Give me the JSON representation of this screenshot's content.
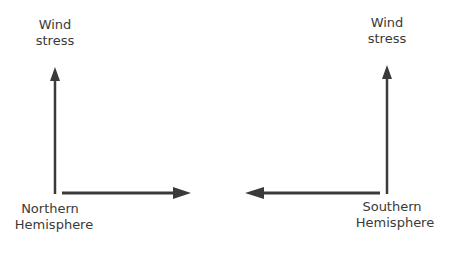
{
  "diagram": {
    "left_panel": {
      "hemisphere_label_line1": "Northern",
      "hemisphere_label_line2": "Hemisphere",
      "vertical_arrow_label_line1": "Wind",
      "vertical_arrow_label_line2": "stress",
      "horizontal_arrow_direction": "right"
    },
    "right_panel": {
      "hemisphere_label_line1": "Southern",
      "hemisphere_label_line2": "Hemisphere",
      "vertical_arrow_label_line1": "Wind",
      "vertical_arrow_label_line2": "stress",
      "horizontal_arrow_direction": "left"
    },
    "colors": {
      "arrow": "#3a3a3a",
      "text": "#3a3a3a",
      "background": "#ffffff"
    }
  }
}
